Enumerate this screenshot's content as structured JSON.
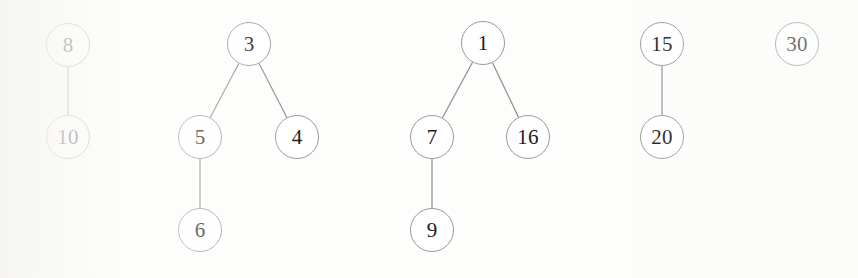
{
  "figure": {
    "type": "binary-forest-diagram",
    "node_radius": 22,
    "background_color": "#fdfdfc",
    "node_fill": "#ffffff",
    "node_stroke": "#9a9a9a",
    "edge_stroke": "#8d8d8d",
    "label_color": "#1b1b1b"
  },
  "trees": [
    {
      "name": "tree-1",
      "root": "8",
      "nodes": [
        {
          "id": "n8",
          "label": "8",
          "x": 68,
          "y": 45
        },
        {
          "id": "n10",
          "label": "10",
          "x": 68,
          "y": 137
        }
      ],
      "edges": [
        {
          "from": "n8",
          "to": "n10"
        }
      ]
    },
    {
      "name": "tree-2",
      "root": "3",
      "nodes": [
        {
          "id": "n3",
          "label": "3",
          "x": 249,
          "y": 44
        },
        {
          "id": "n5",
          "label": "5",
          "x": 200,
          "y": 137
        },
        {
          "id": "n4",
          "label": "4",
          "x": 297,
          "y": 137
        },
        {
          "id": "n6",
          "label": "6",
          "x": 200,
          "y": 230
        }
      ],
      "edges": [
        {
          "from": "n3",
          "to": "n5"
        },
        {
          "from": "n3",
          "to": "n4"
        },
        {
          "from": "n5",
          "to": "n6"
        }
      ]
    },
    {
      "name": "tree-3",
      "root": "1",
      "nodes": [
        {
          "id": "n1",
          "label": "1",
          "x": 483,
          "y": 43
        },
        {
          "id": "n7",
          "label": "7",
          "x": 432,
          "y": 137
        },
        {
          "id": "n16",
          "label": "16",
          "x": 528,
          "y": 137
        },
        {
          "id": "n9",
          "label": "9",
          "x": 432,
          "y": 230
        }
      ],
      "edges": [
        {
          "from": "n1",
          "to": "n7"
        },
        {
          "from": "n1",
          "to": "n16"
        },
        {
          "from": "n7",
          "to": "n9"
        }
      ]
    },
    {
      "name": "tree-4",
      "root": "15",
      "nodes": [
        {
          "id": "n15",
          "label": "15",
          "x": 662,
          "y": 44
        },
        {
          "id": "n20",
          "label": "20",
          "x": 662,
          "y": 137
        }
      ],
      "edges": [
        {
          "from": "n15",
          "to": "n20"
        }
      ]
    },
    {
      "name": "tree-5",
      "root": "30",
      "nodes": [
        {
          "id": "n30",
          "label": "30",
          "x": 797,
          "y": 44
        }
      ],
      "edges": []
    }
  ]
}
